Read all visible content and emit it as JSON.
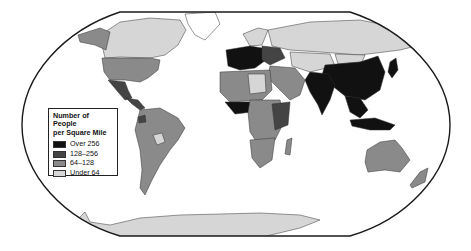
{
  "map": {
    "title": "Number of People per Square Mile",
    "projection": "Robinson-style world map",
    "frame_color": "#1a1a1a",
    "ocean_color": "#ffffff",
    "border_color": "#333333"
  },
  "legend": {
    "title_line1": "Number of People",
    "title_line2": "per Square Mile",
    "items": [
      {
        "label": "Over 256",
        "color": "#111111"
      },
      {
        "label": "128–256",
        "color": "#444444"
      },
      {
        "label": "64–128",
        "color": "#8a8a8a"
      },
      {
        "label": "Under 64",
        "color": "#d6d6d6"
      }
    ]
  },
  "regions": [
    {
      "name": "Canada",
      "class": "Under 64"
    },
    {
      "name": "United States",
      "class": "64–128"
    },
    {
      "name": "Mexico",
      "class": "128–256"
    },
    {
      "name": "Central America & Caribbean",
      "class": "128–256"
    },
    {
      "name": "South America",
      "class": "64–128"
    },
    {
      "name": "Bolivia",
      "class": "Under 64"
    },
    {
      "name": "Greenland",
      "class": "Under 64"
    },
    {
      "name": "Russia",
      "class": "Under 64"
    },
    {
      "name": "Western Europe",
      "class": "Over 256"
    },
    {
      "name": "Eastern Europe",
      "class": "128–256"
    },
    {
      "name": "North Africa",
      "class": "64–128"
    },
    {
      "name": "Libya / Algeria interior",
      "class": "Under 64"
    },
    {
      "name": "Nigeria region",
      "class": "Over 256"
    },
    {
      "name": "Central Africa",
      "class": "64–128"
    },
    {
      "name": "East Africa",
      "class": "128–256"
    },
    {
      "name": "Southern Africa",
      "class": "64–128"
    },
    {
      "name": "Middle East",
      "class": "64–128"
    },
    {
      "name": "Central Asia",
      "class": "Under 64"
    },
    {
      "name": "India",
      "class": "Over 256"
    },
    {
      "name": "China",
      "class": "Over 256"
    },
    {
      "name": "Mongolia",
      "class": "Under 64"
    },
    {
      "name": "Southeast Asia",
      "class": "Over 256"
    },
    {
      "name": "Japan",
      "class": "Over 256"
    },
    {
      "name": "Australia",
      "class": "64–128"
    },
    {
      "name": "New Zealand",
      "class": "64–128"
    },
    {
      "name": "Madagascar",
      "class": "64–128"
    },
    {
      "name": "Antarctica",
      "class": "Under 64"
    }
  ]
}
